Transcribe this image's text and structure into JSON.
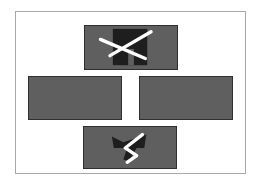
{
  "diagram": {
    "frame": {
      "border_color": "#a8a8a8",
      "fill": "#ffffff"
    },
    "panel_fill": "#5f5f5f",
    "panel_border": "#2f2f2f",
    "glyph_dark": "#1e1e1e",
    "stroke_light": "#ffffff",
    "panels": [
      {
        "id": "top",
        "position": "top-center",
        "glyph": "crossed-pillars-icon"
      },
      {
        "id": "left",
        "position": "middle-left",
        "glyph": "none"
      },
      {
        "id": "right",
        "position": "middle-right",
        "glyph": "none"
      },
      {
        "id": "bottom",
        "position": "bottom-center",
        "glyph": "zigzag-bowtie-icon"
      }
    ]
  }
}
